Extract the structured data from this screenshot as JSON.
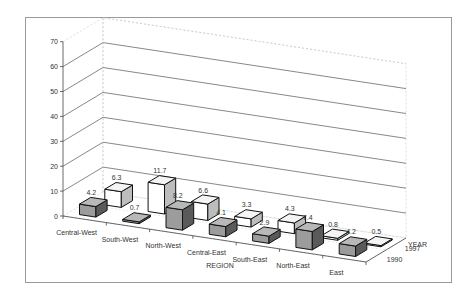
{
  "chart_data": {
    "type": "bar",
    "subtype": "3d-clustered-depth",
    "title": "",
    "xlabel": "REGION",
    "ylabel": "",
    "zlabel": "YEAR",
    "ylim": [
      0,
      70
    ],
    "yticks": [
      0,
      10,
      20,
      30,
      40,
      50,
      60,
      70
    ],
    "grid": true,
    "categories": [
      "Central-West",
      "South-West",
      "North-West",
      "Central-East",
      "South-East",
      "North-East",
      "East"
    ],
    "series": [
      {
        "name": "1990",
        "color": "#9a9a9a",
        "values": [
          4.2,
          0.7,
          8.2,
          4.1,
          2.9,
          7.4,
          4.2
        ]
      },
      {
        "name": "1997",
        "color": "#ffffff",
        "values": [
          6.3,
          11.7,
          6.6,
          3.3,
          4.3,
          0.8,
          0.5
        ]
      }
    ],
    "legend": "depth-axis labels (1990 front, 1997 back)"
  },
  "axis": {
    "region_title": "REGION",
    "year_title": "YEAR",
    "year_labels": [
      "1997",
      "1990"
    ]
  }
}
